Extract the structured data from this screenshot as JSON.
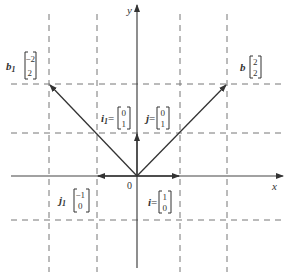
{
  "diagram": {
    "type": "vector-plane",
    "colors": {
      "line": "#444444",
      "dashed": "#777777",
      "text": "#333333",
      "background": "#ffffff"
    },
    "axes": {
      "x_label": "x",
      "y_label": "y",
      "origin_label": "0"
    },
    "grid": {
      "vertical_x": [
        -2,
        -1,
        1,
        2
      ],
      "horizontal_y": [
        2,
        1,
        -1
      ]
    },
    "vectors": [
      {
        "name": "b",
        "symbol": "b",
        "subscript": "",
        "from": [
          0,
          0
        ],
        "to": [
          2,
          2
        ],
        "components": [
          "2",
          "2"
        ]
      },
      {
        "name": "b1",
        "symbol": "b",
        "subscript": "1",
        "from": [
          0,
          0
        ],
        "to": [
          -2,
          2
        ],
        "components": [
          "−2",
          "2"
        ]
      },
      {
        "name": "j",
        "symbol": "j",
        "subscript": "",
        "from": [
          0,
          0
        ],
        "to": [
          0,
          1
        ],
        "components": [
          "0",
          "1"
        ]
      },
      {
        "name": "i1",
        "symbol": "i",
        "subscript": "1",
        "from": [
          0,
          0
        ],
        "to": [
          0,
          1
        ],
        "components": [
          "0",
          "1"
        ]
      },
      {
        "name": "i",
        "symbol": "i",
        "subscript": "",
        "from": [
          0,
          0
        ],
        "to": [
          1,
          0
        ],
        "components": [
          "1",
          "0"
        ]
      },
      {
        "name": "j1",
        "symbol": "j",
        "subscript": "1",
        "from": [
          0,
          0
        ],
        "to": [
          -1,
          0
        ],
        "components": [
          "−1",
          "0"
        ]
      }
    ],
    "labels": {
      "b": {
        "name": "b",
        "top": "2",
        "bottom": "2"
      },
      "b1": {
        "name": "b",
        "sub": "1",
        "top": "−2",
        "bottom": "2"
      },
      "i1": {
        "name": "i",
        "sub": "1",
        "eq": "=",
        "top": "0",
        "bottom": "1"
      },
      "j": {
        "name": "j",
        "eq": "=",
        "top": "0",
        "bottom": "1"
      },
      "j1": {
        "name": "j",
        "sub": "1",
        "top": "−1",
        "bottom": "0"
      },
      "i": {
        "name": "i",
        "eq": "=",
        "top": "1",
        "bottom": "0"
      }
    }
  }
}
